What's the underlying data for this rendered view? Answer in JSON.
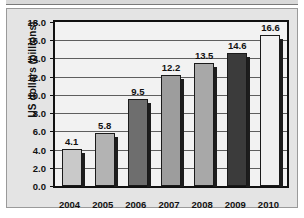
{
  "chart_data": {
    "type": "bar",
    "title": "",
    "xlabel": "",
    "ylabel": "US dollars (billions)",
    "categories": [
      "2004",
      "2005",
      "2006",
      "2007",
      "2008",
      "2009",
      "2010"
    ],
    "values": [
      4.1,
      5.8,
      9.5,
      12.2,
      13.5,
      14.6,
      16.6
    ],
    "data_labels": [
      "4.1",
      "5.8",
      "9.5",
      "12.2",
      "13.5",
      "14.6",
      "16.6"
    ],
    "ylim": [
      0.0,
      18.0
    ],
    "ytick_labels": [
      "18.0",
      "16.0",
      "14.0",
      "12.0",
      "10.0",
      "8.0",
      "6.0",
      "4.0",
      "2.0",
      "0.0"
    ],
    "ytick_values": [
      18.0,
      16.0,
      14.0,
      12.0,
      10.0,
      8.0,
      6.0,
      4.0,
      2.0,
      0.0
    ],
    "ytick_step": 2.0,
    "grid": true,
    "legend": false,
    "bar_colors": [
      "#c9c9c9",
      "#b3b3b3",
      "#6e6e6e",
      "#9d9d9d",
      "#a8a8a8",
      "#3b3b3b",
      "#f0f0f0"
    ],
    "plot_background": "#f2f2f2",
    "figure_background": "#e4e4e4",
    "axis_color": "#111111",
    "gridline_color": "#5e5e5e"
  }
}
